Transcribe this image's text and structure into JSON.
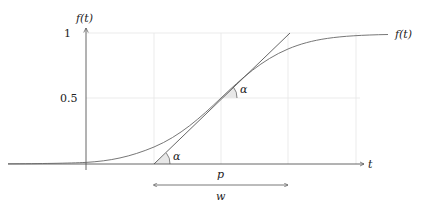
{
  "diagram": {
    "y_axis_label": "f(t)",
    "x_axis_label": "t",
    "y_ticks": [
      {
        "label": "1",
        "value": 1
      },
      {
        "label": "0.5",
        "value": 0.5
      }
    ],
    "curve_label": "f(t)",
    "inflection_label": "p",
    "width_label": "w",
    "angle_label_top": "α",
    "angle_label_bottom": "α",
    "colors": {
      "axis": "#555555",
      "grid": "#e6e6e6",
      "curve": "#666666",
      "tangent": "#555555",
      "angle_fill": "#e8e8e8"
    }
  }
}
